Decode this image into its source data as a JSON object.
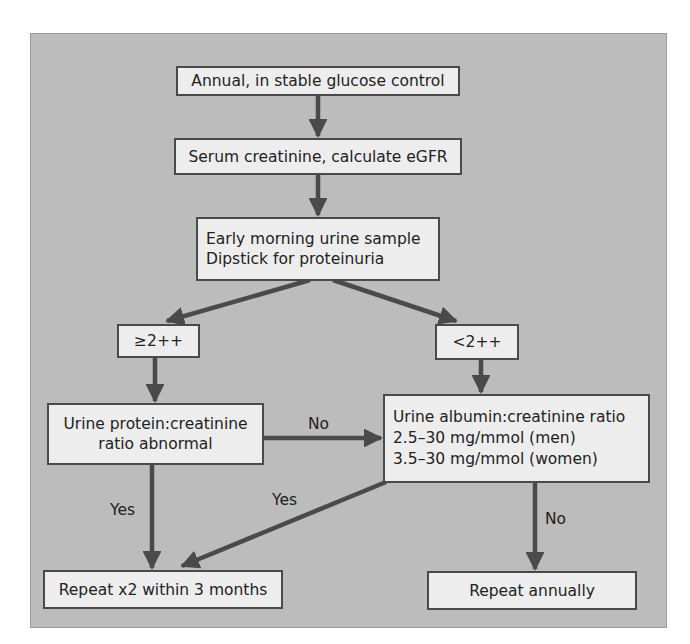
{
  "colors": {
    "panel_background": "#bcbcbc",
    "box_fill": "#ededed",
    "box_border": "#4a4a4a",
    "arrow": "#4a4a4a",
    "text": "#222222"
  },
  "nodes": {
    "annual": {
      "lines": [
        "Annual, in stable glucose control"
      ]
    },
    "serum": {
      "lines": [
        "Serum creatinine, calculate eGFR"
      ]
    },
    "urine_sample": {
      "lines": [
        "Early morning urine sample",
        "Dipstick for proteinuria"
      ]
    },
    "ge2": {
      "lines": [
        "≥2++"
      ]
    },
    "lt2": {
      "lines": [
        "<2++"
      ]
    },
    "pcr": {
      "lines": [
        "Urine protein:creatinine",
        "ratio abnormal"
      ]
    },
    "acr": {
      "lines": [
        "Urine albumin:creatinine ratio",
        "2.5–30 mg/mmol (men)",
        "3.5–30 mg/mmol (women)"
      ]
    },
    "repeat_x2": {
      "lines": [
        "Repeat x2 within 3 months"
      ]
    },
    "repeat_annual": {
      "lines": [
        "Repeat annually"
      ]
    }
  },
  "edge_labels": {
    "pcr_to_acr": "No",
    "pcr_to_repeat": "Yes",
    "acr_to_repeat": "Yes",
    "acr_to_annual": "No"
  },
  "edges": [
    {
      "from": "annual",
      "to": "serum",
      "label": ""
    },
    {
      "from": "serum",
      "to": "urine_sample",
      "label": ""
    },
    {
      "from": "urine_sample",
      "to": "ge2",
      "label": ""
    },
    {
      "from": "urine_sample",
      "to": "lt2",
      "label": ""
    },
    {
      "from": "ge2",
      "to": "pcr",
      "label": ""
    },
    {
      "from": "lt2",
      "to": "acr",
      "label": ""
    },
    {
      "from": "pcr",
      "to": "acr",
      "label": "No"
    },
    {
      "from": "pcr",
      "to": "repeat_x2",
      "label": "Yes"
    },
    {
      "from": "acr",
      "to": "repeat_x2",
      "label": "Yes"
    },
    {
      "from": "acr",
      "to": "repeat_annual",
      "label": "No"
    }
  ]
}
